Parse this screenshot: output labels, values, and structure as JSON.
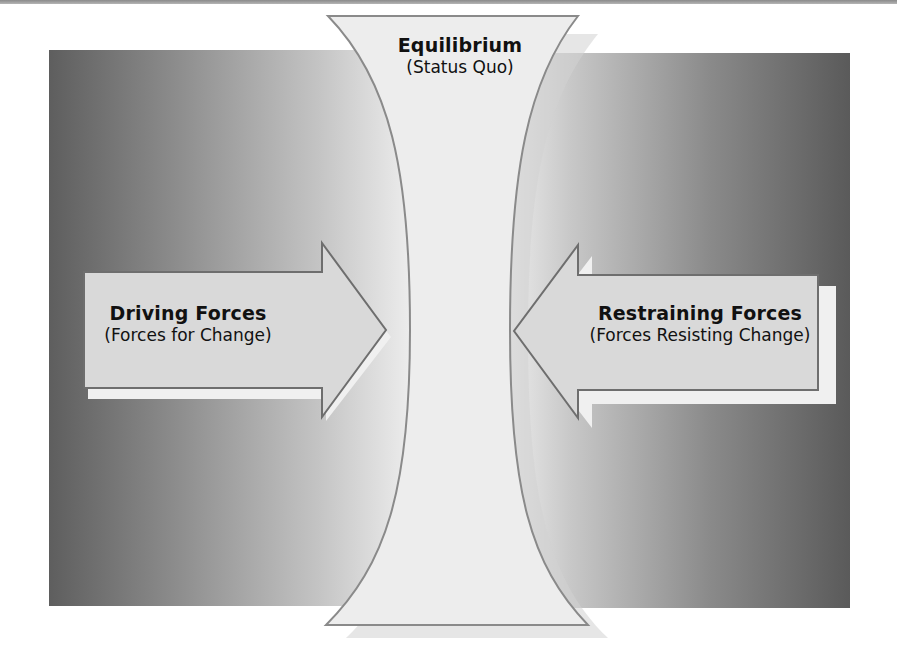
{
  "diagram": {
    "type": "force-field-analysis",
    "equilibrium": {
      "title": "Equilibrium",
      "subtitle": "(Status Quo)"
    },
    "driving_forces": {
      "title": "Driving Forces",
      "subtitle": "(Forces for Change)",
      "direction": "right"
    },
    "restraining_forces": {
      "title": "Restraining Forces",
      "subtitle": "(Forces Resisting Change)",
      "direction": "left"
    },
    "colors": {
      "panel_dark": "#5e5e5e",
      "panel_light": "#ececec",
      "shape_fill": "#d8d8d8",
      "hourglass_fill": "#eeeeee",
      "outline": "#7a7a7a",
      "shadow": "#f4f4f4",
      "text": "#111111"
    }
  }
}
